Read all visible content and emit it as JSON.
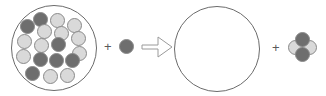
{
  "diagram": {
    "type": "chemical-reaction-schematic",
    "colors": {
      "dark_sphere": "#6e6e6e",
      "light_sphere": "#d9d9d9",
      "sphere_outline": "#8a8a8a",
      "container_outline": "#6b6b6b",
      "arrow_outline": "#9a9a9a",
      "symbol": "#5a5a5a",
      "background": "#ffffff"
    },
    "operators": {
      "plus_left": "+",
      "plus_right": "+",
      "arrow": "yields-arrow"
    },
    "reactant_container": {
      "label": "mixture-container",
      "cx": 54,
      "cy": 48,
      "r": 43,
      "sphere_radius": 7.5,
      "spheres": [
        {
          "cx": 40.5,
          "cy": 19.0,
          "shade": "dark"
        },
        {
          "cx": 57.5,
          "cy": 20.0,
          "shade": "light"
        },
        {
          "cx": 74.0,
          "cy": 25.0,
          "shade": "light"
        },
        {
          "cx": 27.0,
          "cy": 26.5,
          "shade": "dark"
        },
        {
          "cx": 44.0,
          "cy": 31.0,
          "shade": "light"
        },
        {
          "cx": 61.0,
          "cy": 33.5,
          "shade": "light"
        },
        {
          "cx": 78.5,
          "cy": 38.0,
          "shade": "light"
        },
        {
          "cx": 24.0,
          "cy": 41.0,
          "shade": "light"
        },
        {
          "cx": 41.5,
          "cy": 45.0,
          "shade": "light"
        },
        {
          "cx": 58.5,
          "cy": 44.5,
          "shade": "dark"
        },
        {
          "cx": 79.0,
          "cy": 53.0,
          "shade": "light"
        },
        {
          "cx": 23.5,
          "cy": 56.0,
          "shade": "light"
        },
        {
          "cx": 40.0,
          "cy": 59.0,
          "shade": "dark"
        },
        {
          "cx": 56.5,
          "cy": 60.0,
          "shade": "dark"
        },
        {
          "cx": 72.0,
          "cy": 60.5,
          "shade": "dark"
        },
        {
          "cx": 32.5,
          "cy": 73.0,
          "shade": "dark"
        },
        {
          "cx": 50.0,
          "cy": 76.0,
          "shade": "light"
        },
        {
          "cx": 67.5,
          "cy": 75.0,
          "shade": "light"
        }
      ],
      "sphere_count": 18,
      "dark_count": 7,
      "light_count": 11
    },
    "reactant_single": {
      "label": "single-dark-sphere",
      "cx": 126,
      "cy": 46.5,
      "r": 7.5,
      "shade": "dark"
    },
    "product_container": {
      "label": "empty-container",
      "cx": 217,
      "cy": 49,
      "r": 43
    },
    "product_molecule": {
      "label": "four-sphere-molecule",
      "sphere_radius": 7.5,
      "spheres": [
        {
          "cx": 295.0,
          "cy": 47.0,
          "shade": "light",
          "z": 1
        },
        {
          "cx": 309.0,
          "cy": 47.0,
          "shade": "light",
          "z": 1
        },
        {
          "cx": 302.0,
          "cy": 39.5,
          "shade": "dark",
          "z": 2
        },
        {
          "cx": 302.0,
          "cy": 54.5,
          "shade": "dark",
          "z": 2
        }
      ],
      "sphere_count": 4,
      "dark_count": 2,
      "light_count": 2
    },
    "plus_left_pos": {
      "x": 104,
      "y": 40
    },
    "plus_right_pos": {
      "x": 272,
      "y": 41
    },
    "arrow": {
      "x": 141,
      "y": 35,
      "width": 33,
      "height": 24,
      "points": "1,10 17,10 17,2 31,12 17,22 17,14 1,14"
    }
  }
}
